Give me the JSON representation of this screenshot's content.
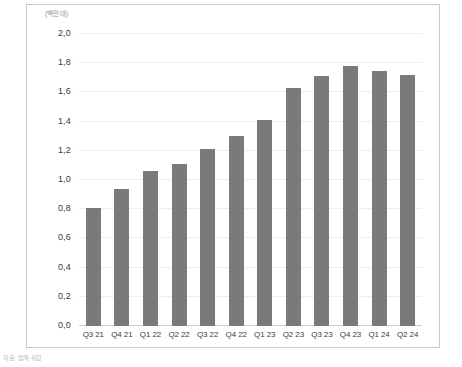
{
  "figure": {
    "unit_label": "(백만 대)",
    "source_note": "자료: 업계 취합"
  },
  "chart_data": {
    "type": "bar",
    "title": "",
    "subtitle": "",
    "xlabel": "",
    "ylabel": "",
    "unit": "(백만 대)",
    "categories": [
      "Q3 21",
      "Q4 21",
      "Q1 22",
      "Q2 22",
      "Q3 22",
      "Q4 22",
      "Q1 23",
      "Q2 23",
      "Q3 23",
      "Q4 23",
      "Q1 24",
      "Q2 24"
    ],
    "values": [
      0.81,
      0.94,
      1.06,
      1.11,
      1.21,
      1.3,
      1.41,
      1.63,
      1.71,
      1.78,
      1.75,
      1.72
    ],
    "value_labels": [
      "0,81",
      "0,94",
      "1,06",
      "1,11",
      "1,21",
      "1,30",
      "1,41",
      "1,63",
      "1,71",
      "1,78",
      "1,75",
      "1,72"
    ],
    "ylim": [
      0.0,
      2.0
    ],
    "ytick_values": [
      2.0,
      1.8,
      1.6,
      1.4,
      1.2,
      1.0,
      0.8,
      0.6,
      0.4,
      0.2,
      0.0
    ],
    "ytick_labels": [
      "2,0",
      "1,8",
      "1,6",
      "1,4",
      "1,2",
      "1,0",
      "0,8",
      "0,6",
      "0,4",
      "0,2",
      "0,0"
    ],
    "grid": true,
    "legend": false,
    "legend_position": "none",
    "bar_color": "#7a7a7a",
    "gridline_color": "#ededed",
    "frame_color": "#c9c9c9",
    "decimal_separator": ","
  }
}
